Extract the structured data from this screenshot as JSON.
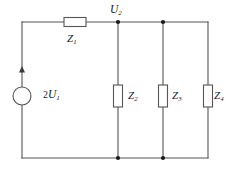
{
  "figure": {
    "type": "electrical-circuit-schematic",
    "background_color": "#ffffff",
    "line_color": "#555555",
    "text_color": "#1a1a1a"
  },
  "labels": {
    "node_voltage": {
      "symbol": "U",
      "subscript": "2"
    },
    "source": {
      "coefficient": "2",
      "symbol": "U",
      "subscript": "1"
    },
    "z1": {
      "symbol": "Z",
      "subscript": "1"
    },
    "z2": {
      "symbol": "Z",
      "subscript": "2"
    },
    "z3": {
      "symbol": "Z",
      "subscript": "3"
    },
    "z4": {
      "symbol": "Z",
      "subscript": "4"
    }
  },
  "components": {
    "source_type": "circle-voltage-source",
    "current_arrow_direction": "up",
    "series_impedance": "Z1",
    "parallel_impedances": [
      "Z2",
      "Z3",
      "Z4"
    ],
    "junction_nodes": 4
  }
}
